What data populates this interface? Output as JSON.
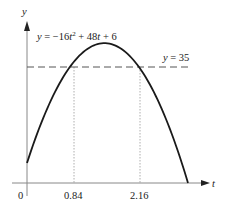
{
  "chart_data": {
    "type": "line",
    "title": "",
    "xlabel": "t",
    "ylabel": "y",
    "equation_label": "y = −16t² + 48t + 6",
    "curve": {
      "a": -16,
      "b": 48,
      "c": 6,
      "t_start": 0,
      "t_end": 3.12
    },
    "series": [
      {
        "name": "y = −16t² + 48t + 6",
        "style": "solid",
        "x": [
          0,
          0.5,
          0.84,
          1.0,
          1.5,
          2.0,
          2.16,
          2.5,
          3.0,
          3.12
        ],
        "values": [
          6,
          26,
          35,
          38,
          42,
          38,
          35,
          26,
          6,
          0
        ]
      },
      {
        "name": "y = 35",
        "style": "dashed",
        "x": [
          0,
          3.15
        ],
        "values": [
          35,
          35
        ]
      }
    ],
    "horizontal_line": {
      "y": 35,
      "label": "y = 35"
    },
    "intersections": [
      {
        "t": 0.84,
        "y": 35,
        "label": "0.84"
      },
      {
        "t": 2.16,
        "y": 35,
        "label": "2.16"
      }
    ],
    "x_tick_labels": [
      "0",
      "0.84",
      "2.16"
    ],
    "xlim": [
      0,
      3.4
    ],
    "ylim": [
      0,
      48
    ],
    "grid": false,
    "legend": null
  },
  "labels": {
    "y_axis": "y",
    "t_axis": "t",
    "origin": "0",
    "tick1": "0.84",
    "tick2": "2.16",
    "hline_y": "y",
    "hline_eq": " = 35",
    "eq_y": "y",
    "eq_rest1": " = −16",
    "eq_t1": "t",
    "eq_sup": "2",
    "eq_rest2": " + 48",
    "eq_t2": "t",
    "eq_rest3": " + 6"
  }
}
